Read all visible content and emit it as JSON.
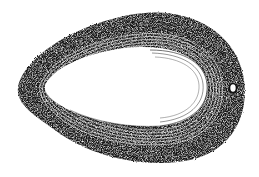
{
  "figure": {
    "background_color": "#ffffff",
    "ink_color": "#111111",
    "ring_count": 12,
    "has_small_hole": true
  }
}
